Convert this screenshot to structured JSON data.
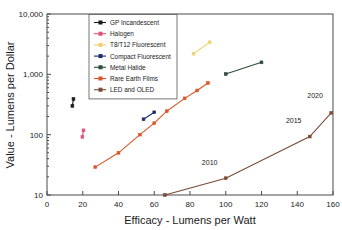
{
  "chart_data": {
    "type": "line",
    "title": "",
    "xlabel": "Efficacy - Lumens per Watt",
    "ylabel": "Value - Lumens per Dollar",
    "xlim": [
      0,
      160
    ],
    "ylim": [
      10,
      10000
    ],
    "yscale": "log",
    "xscale": "linear",
    "grid": false,
    "legend_position": "upper-center-left",
    "xticks": [
      0,
      20,
      40,
      60,
      80,
      100,
      120,
      140,
      160
    ],
    "xtick_labels": [
      "0",
      "20",
      "40",
      "60",
      "80",
      "100",
      "120",
      "140",
      "160"
    ],
    "yticks": [
      10,
      100,
      1000,
      10000
    ],
    "ytick_labels": [
      "10",
      "100",
      "1,000",
      "10,000"
    ],
    "series": [
      {
        "name": "GP Incandescent",
        "color": "#1a1a1a",
        "points": [
          [
            14.2,
            300
          ],
          [
            14.8,
            390
          ]
        ]
      },
      {
        "name": "Halogen",
        "color": "#e0527a",
        "points": [
          [
            19.8,
            92
          ],
          [
            20.4,
            118
          ]
        ]
      },
      {
        "name": "T8/T12 Fluorescent",
        "color": "#f0d171",
        "points": [
          [
            82,
            2200
          ],
          [
            91,
            3400
          ]
        ]
      },
      {
        "name": "Compact Fluorescent",
        "color": "#1f2d6e",
        "points": [
          [
            54,
            180
          ],
          [
            60,
            235
          ]
        ]
      },
      {
        "name": "Metal Halide",
        "color": "#2e4a3a",
        "points": [
          [
            100,
            1010
          ],
          [
            120,
            1580
          ]
        ]
      },
      {
        "name": "Rare Earth Films",
        "color": "#d9572a",
        "points": [
          [
            27,
            29
          ],
          [
            40,
            50
          ],
          [
            52,
            100
          ],
          [
            60,
            155
          ],
          [
            67,
            245
          ],
          [
            77,
            400
          ],
          [
            84,
            540
          ],
          [
            90,
            720
          ]
        ]
      },
      {
        "name": "LED and OLED",
        "color": "#7a4a33",
        "points": [
          [
            66,
            10
          ],
          [
            100,
            19
          ],
          [
            147,
            93
          ],
          [
            159,
            230
          ]
        ]
      }
    ],
    "annotations": [
      {
        "text": "2010",
        "x": 91,
        "y": 31
      },
      {
        "text": "2015",
        "x": 138,
        "y": 155
      },
      {
        "text": "2020",
        "x": 150,
        "y": 400
      }
    ],
    "legend_entries": [
      {
        "label": "GP Incandescent",
        "color": "#1a1a1a"
      },
      {
        "label": "Halogen",
        "color": "#e0527a"
      },
      {
        "label": "T8/T12 Fluorescent",
        "color": "#f0d171"
      },
      {
        "label": "Compact Fluorescent",
        "color": "#1f2d6e"
      },
      {
        "label": "Metal Halide",
        "color": "#2e4a3a"
      },
      {
        "label": "Rare Earth Films",
        "color": "#d9572a"
      },
      {
        "label": "LED and OLED",
        "color": "#7a4a33"
      }
    ]
  }
}
